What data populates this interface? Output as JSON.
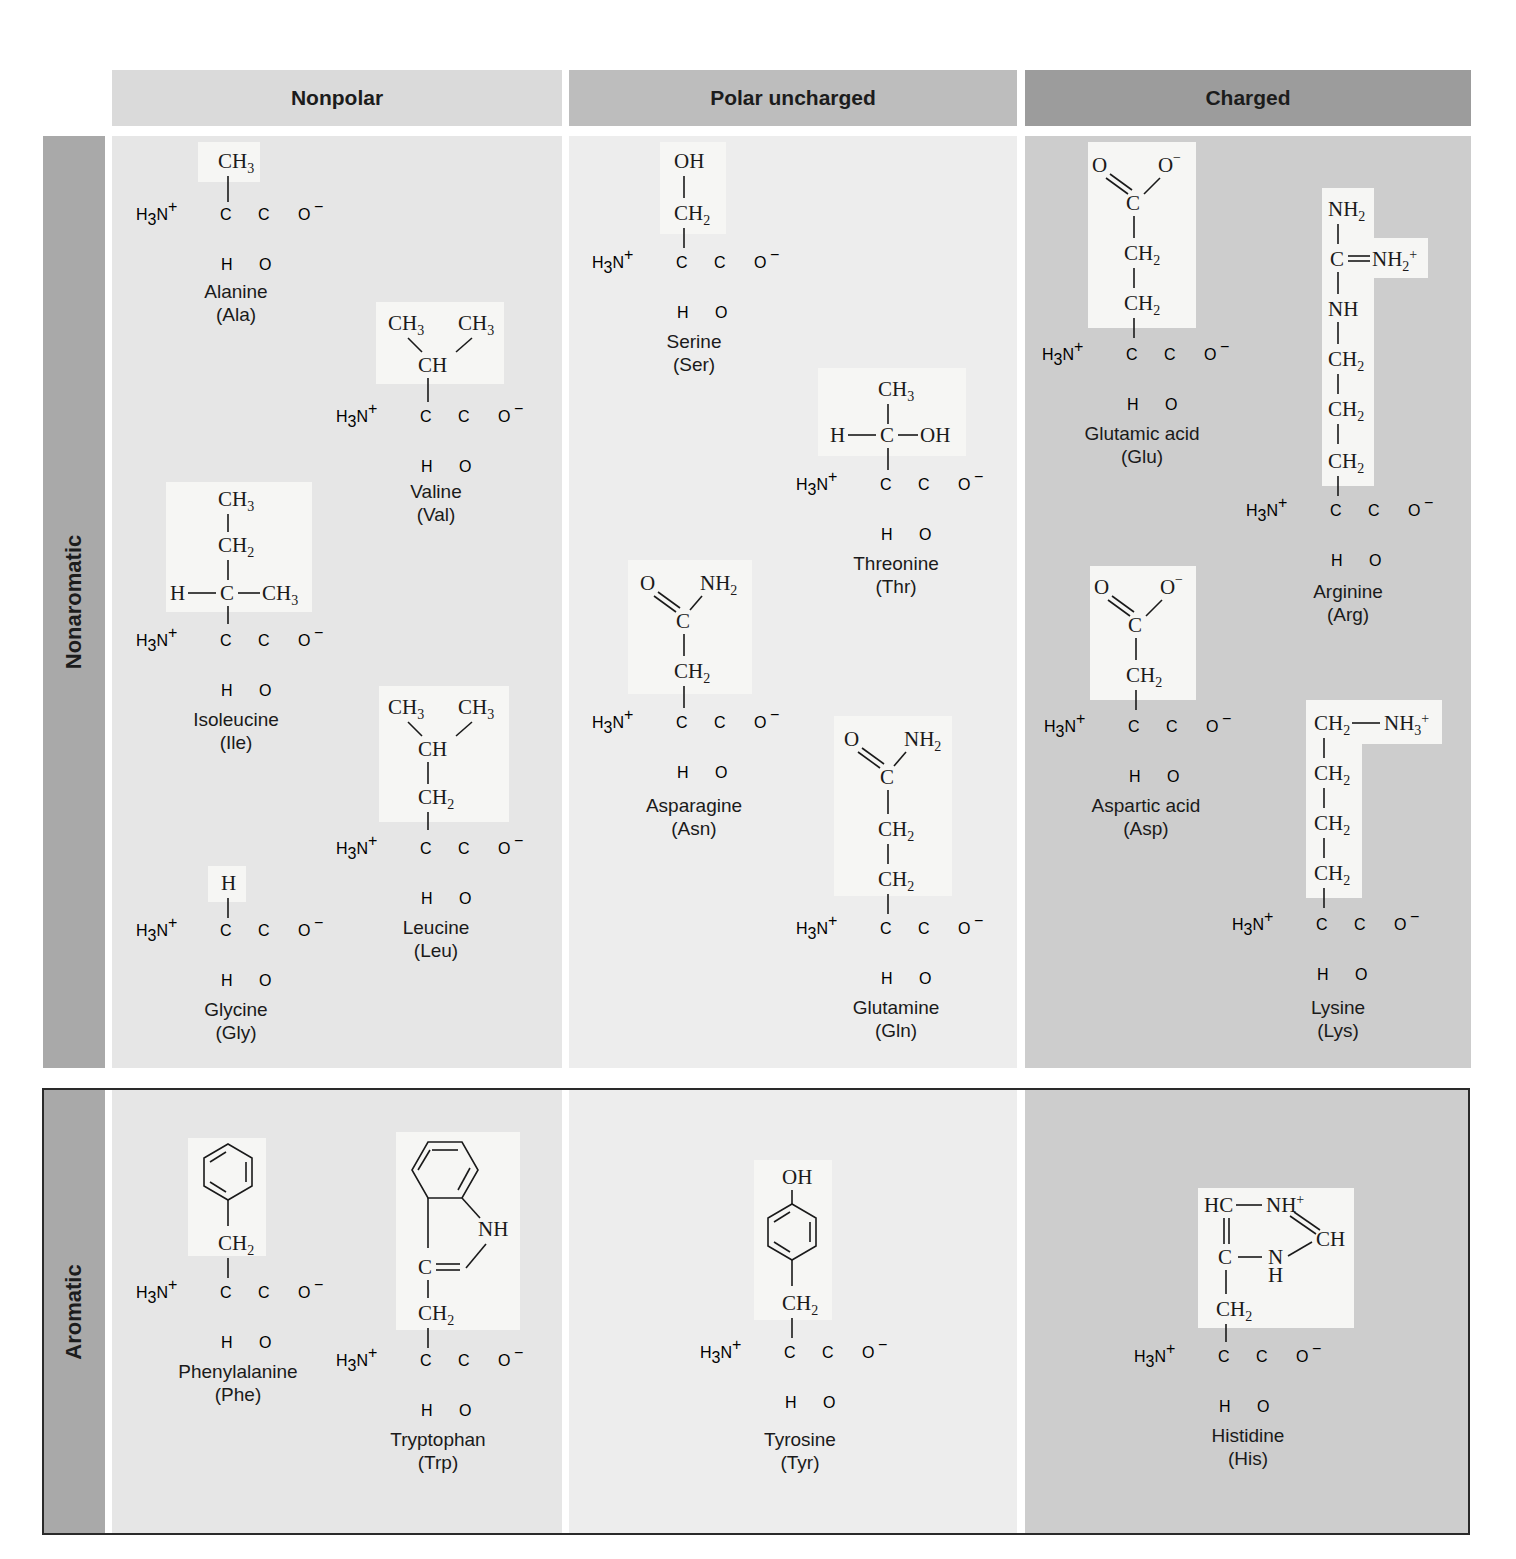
{
  "columns": {
    "nonpolar": {
      "label": "Nonpolar",
      "color": "#dadada"
    },
    "polar": {
      "label": "Polar uncharged",
      "color": "#bdbdbd"
    },
    "charged": {
      "label": "Charged",
      "color": "#999999"
    }
  },
  "rows": {
    "nonaromatic": {
      "label": "Nonaromatic",
      "color": "#a8a8a8"
    },
    "aromatic": {
      "label": "Aromatic",
      "color": "#a8a8a8"
    }
  },
  "backbone": {
    "amine": "H₃N⁺",
    "alpha_carbon": "C",
    "carboxyl_carbon": "C",
    "carboxylate_oxygen": "O⁻",
    "alpha_hydrogen": "H",
    "carbonyl_oxygen": "O"
  },
  "amino_acids": [
    {
      "id": "ala",
      "name": "Alanine",
      "abbr": "(Ala)",
      "category": "Nonpolar",
      "row": "Nonaromatic",
      "side_chain": [
        "CH₃"
      ]
    },
    {
      "id": "val",
      "name": "Valine",
      "abbr": "(Val)",
      "category": "Nonpolar",
      "row": "Nonaromatic",
      "side_chain": [
        "CH₃",
        "CH₃",
        "CH"
      ]
    },
    {
      "id": "ile",
      "name": "Isoleucine",
      "abbr": "(Ile)",
      "category": "Nonpolar",
      "row": "Nonaromatic",
      "side_chain": [
        "CH₃",
        "CH₂",
        "H",
        "C",
        "CH₃"
      ]
    },
    {
      "id": "leu",
      "name": "Leucine",
      "abbr": "(Leu)",
      "category": "Nonpolar",
      "row": "Nonaromatic",
      "side_chain": [
        "CH₃",
        "CH₃",
        "CH",
        "CH₂"
      ]
    },
    {
      "id": "gly",
      "name": "Glycine",
      "abbr": "(Gly)",
      "category": "Nonpolar",
      "row": "Nonaromatic",
      "side_chain": [
        "H"
      ]
    },
    {
      "id": "ser",
      "name": "Serine",
      "abbr": "(Ser)",
      "category": "Polar uncharged",
      "row": "Nonaromatic",
      "side_chain": [
        "OH",
        "CH₂"
      ]
    },
    {
      "id": "thr",
      "name": "Threonine",
      "abbr": "(Thr)",
      "category": "Polar uncharged",
      "row": "Nonaromatic",
      "side_chain": [
        "CH₃",
        "H",
        "C",
        "OH"
      ]
    },
    {
      "id": "asn",
      "name": "Asparagine",
      "abbr": "(Asn)",
      "category": "Polar uncharged",
      "row": "Nonaromatic",
      "side_chain": [
        "O",
        "NH₂",
        "C",
        "CH₂"
      ]
    },
    {
      "id": "gln",
      "name": "Glutamine",
      "abbr": "(Gln)",
      "category": "Polar uncharged",
      "row": "Nonaromatic",
      "side_chain": [
        "O",
        "NH₂",
        "C",
        "CH₂",
        "CH₂"
      ]
    },
    {
      "id": "glu",
      "name": "Glutamic acid",
      "abbr": "(Glu)",
      "category": "Charged",
      "row": "Nonaromatic",
      "side_chain": [
        "O",
        "O⁻",
        "C",
        "CH₂",
        "CH₂"
      ]
    },
    {
      "id": "arg",
      "name": "Arginine",
      "abbr": "(Arg)",
      "category": "Charged",
      "row": "Nonaromatic",
      "side_chain": [
        "NH₂",
        "C",
        "NH₂⁺",
        "NH",
        "CH₂",
        "CH₂",
        "CH₂"
      ]
    },
    {
      "id": "asp",
      "name": "Aspartic acid",
      "abbr": "(Asp)",
      "category": "Charged",
      "row": "Nonaromatic",
      "side_chain": [
        "O",
        "O⁻",
        "C",
        "CH₂"
      ]
    },
    {
      "id": "lys",
      "name": "Lysine",
      "abbr": "(Lys)",
      "category": "Charged",
      "row": "Nonaromatic",
      "side_chain": [
        "CH₂",
        "NH₃⁺",
        "CH₂",
        "CH₂",
        "CH₂"
      ]
    },
    {
      "id": "phe",
      "name": "Phenylalanine",
      "abbr": "(Phe)",
      "category": "Nonpolar",
      "row": "Aromatic",
      "side_chain": [
        "benzene-ring",
        "CH₂"
      ]
    },
    {
      "id": "trp",
      "name": "Tryptophan",
      "abbr": "(Trp)",
      "category": "Nonpolar",
      "row": "Aromatic",
      "side_chain": [
        "benzene-ring",
        "NH",
        "C",
        "CH₂"
      ]
    },
    {
      "id": "tyr",
      "name": "Tyrosine",
      "abbr": "(Tyr)",
      "category": "Polar uncharged",
      "row": "Aromatic",
      "side_chain": [
        "OH",
        "benzene-ring",
        "CH₂"
      ]
    },
    {
      "id": "his",
      "name": "Histidine",
      "abbr": "(His)",
      "category": "Charged",
      "row": "Aromatic",
      "side_chain": [
        "HC",
        "NH⁺",
        "CH",
        "C",
        "N",
        "H",
        "CH₂"
      ]
    }
  ]
}
